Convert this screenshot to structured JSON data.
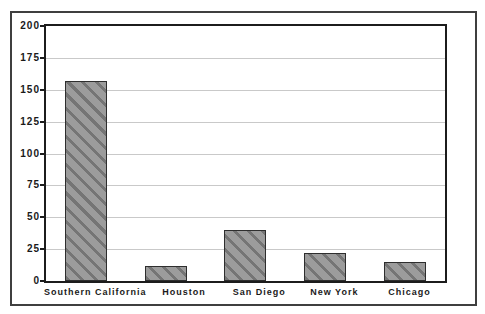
{
  "chart_data": {
    "type": "bar",
    "categories": [
      "Southern California",
      "Houston",
      "San Diego",
      "New York",
      "Chicago"
    ],
    "values": [
      157,
      12,
      40,
      22,
      15
    ],
    "title": "",
    "xlabel": "",
    "ylabel": "",
    "ylim": [
      0,
      200
    ],
    "yticks": [
      0,
      25,
      50,
      75,
      100,
      125,
      150,
      175,
      200
    ],
    "grid": true,
    "legend": "none",
    "bar_style": {
      "fill": "#9c9c9c",
      "hatch": "diagonal-down",
      "hatch_color": "#757575",
      "border_color": "#2e2e2e"
    }
  },
  "colors": {
    "background": "#ffffff",
    "frame_border": "#3f3f3f",
    "plot_border": "#1c1c1c",
    "gridline": "#c9c9c9",
    "label": "#1a1a1a"
  }
}
